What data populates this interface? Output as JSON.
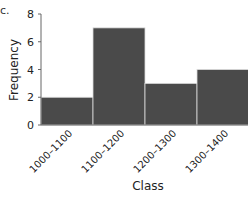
{
  "panel_label": "c.",
  "chart_data": {
    "type": "bar",
    "title": "",
    "xlabel": "Class",
    "ylabel": "Frequency",
    "categories": [
      "1000–1100",
      "1100–1200",
      "1200–1300",
      "1300–1400"
    ],
    "values": [
      2,
      7,
      3,
      4
    ],
    "ylim": [
      0,
      8
    ],
    "yticks": [
      "0",
      "2",
      "4",
      "6",
      "8"
    ],
    "grid": false,
    "legend": null,
    "bar_color": "#4a4a4a",
    "histogram": true
  }
}
